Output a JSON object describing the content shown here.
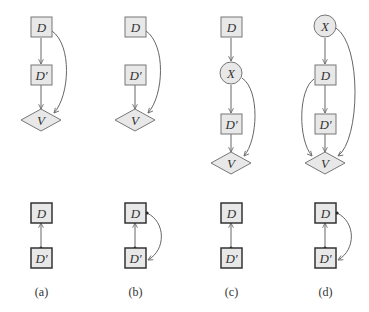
{
  "colors": {
    "node_fill": "#e8e8e8",
    "node_stroke": "#777777",
    "bold_stroke": "#333333",
    "edge": "#666666",
    "text": "#333333"
  },
  "panels": [
    {
      "id": "a",
      "caption": "(a)",
      "top_graph": {
        "nodes": [
          {
            "label": "D",
            "shape": "square"
          },
          {
            "label": "D′",
            "shape": "square"
          },
          {
            "label": "V",
            "shape": "diamond"
          }
        ],
        "edges": [
          "D→D′",
          "D′→V",
          "D→V (curved)"
        ]
      },
      "bottom_graph": {
        "nodes": [
          {
            "label": "D",
            "shape": "square"
          },
          {
            "label": "D′",
            "shape": "square"
          }
        ],
        "edges": [
          "D′→D"
        ]
      }
    },
    {
      "id": "b",
      "caption": "(b)",
      "top_graph": {
        "nodes": [
          {
            "label": "D",
            "shape": "square"
          },
          {
            "label": "D′",
            "shape": "square"
          },
          {
            "label": "V",
            "shape": "diamond"
          }
        ],
        "edges": [
          "D′→V",
          "D→V (curved)"
        ]
      },
      "bottom_graph": {
        "nodes": [
          {
            "label": "D",
            "shape": "square"
          },
          {
            "label": "D′",
            "shape": "square"
          }
        ],
        "edges": [
          "D′→D",
          "D→D′ (curved)"
        ]
      }
    },
    {
      "id": "c",
      "caption": "(c)",
      "top_graph": {
        "nodes": [
          {
            "label": "D",
            "shape": "square"
          },
          {
            "label": "X",
            "shape": "circle"
          },
          {
            "label": "D′",
            "shape": "square"
          },
          {
            "label": "V",
            "shape": "diamond"
          }
        ],
        "edges": [
          "D→X",
          "X→D′",
          "D′→V",
          "X→V (curved)"
        ]
      },
      "bottom_graph": {
        "nodes": [
          {
            "label": "D",
            "shape": "square"
          },
          {
            "label": "D′",
            "shape": "square"
          }
        ],
        "edges": [
          "D′→D"
        ]
      }
    },
    {
      "id": "d",
      "caption": "(d)",
      "top_graph": {
        "nodes": [
          {
            "label": "X",
            "shape": "circle"
          },
          {
            "label": "D",
            "shape": "square"
          },
          {
            "label": "D′",
            "shape": "square"
          },
          {
            "label": "V",
            "shape": "diamond"
          }
        ],
        "edges": [
          "X→D",
          "D→D′",
          "D′→V",
          "D→V (curved left)",
          "X→V (curved right)"
        ]
      },
      "bottom_graph": {
        "nodes": [
          {
            "label": "D",
            "shape": "square"
          },
          {
            "label": "D′",
            "shape": "square"
          }
        ],
        "edges": [
          "D′→D",
          "D→D′ (curved)"
        ]
      }
    }
  ],
  "labels": {
    "a": {
      "d": "D",
      "dp": "D′",
      "v": "V",
      "bd": "D",
      "bdp": "D′",
      "cap": "(a)"
    },
    "b": {
      "d": "D",
      "dp": "D′",
      "v": "V",
      "bd": "D",
      "bdp": "D′",
      "cap": "(b)"
    },
    "c": {
      "d": "D",
      "x": "X",
      "dp": "D′",
      "v": "V",
      "bd": "D",
      "bdp": "D′",
      "cap": "(c)"
    },
    "d": {
      "x": "X",
      "d": "D",
      "dp": "D′",
      "v": "V",
      "bd": "D",
      "bdp": "D′",
      "cap": "(d)"
    }
  }
}
